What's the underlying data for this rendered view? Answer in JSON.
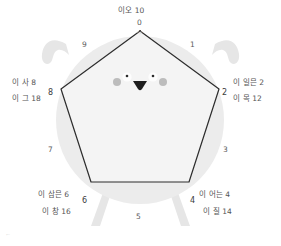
{
  "figure": {
    "title_label": "이오 10",
    "colors": {
      "body_fill": "#ececec",
      "limb_fill": "#e4e4e4",
      "pentagon_fill": "#f4f4f4",
      "pentagon_stroke": "#2d2d2d",
      "eye_white": "#fdfdfd",
      "pupil": "#2b2b2b",
      "blush": "#b9b9b9",
      "mouth": "#1d1d1d",
      "tick_text": "#5a5a5a",
      "label_text": "#555555",
      "background": "#ffffff"
    },
    "shape": {
      "type": "pentagon",
      "sides": 5,
      "tick_count": 10
    },
    "ticks": [
      {
        "id": "tick-0",
        "value": "0",
        "x": 137,
        "y": 18
      },
      {
        "id": "tick-1",
        "value": "1",
        "x": 190,
        "y": 40
      },
      {
        "id": "tick-2",
        "value": "2",
        "x": 222,
        "y": 88
      },
      {
        "id": "tick-3",
        "value": "3",
        "x": 223,
        "y": 145
      },
      {
        "id": "tick-4",
        "value": "4",
        "x": 190,
        "y": 196
      },
      {
        "id": "tick-5",
        "value": "5",
        "x": 136,
        "y": 212
      },
      {
        "id": "tick-6",
        "value": "6",
        "x": 82,
        "y": 196
      },
      {
        "id": "tick-7",
        "value": "7",
        "x": 48,
        "y": 145
      },
      {
        "id": "tick-8",
        "value": "8",
        "x": 48,
        "y": 88
      },
      {
        "id": "tick-9",
        "value": "9",
        "x": 82,
        "y": 40
      }
    ],
    "vertex_labels": [
      {
        "id": "vertex-label-top",
        "position": "top",
        "lines": [
          "이오 10"
        ],
        "x": 118,
        "y": 4,
        "align": "left"
      },
      {
        "id": "vertex-label-right",
        "position": "right",
        "lines": [
          "이 일믄 2",
          "이 목 12"
        ],
        "x": 233,
        "y": 76,
        "align": "left"
      },
      {
        "id": "vertex-label-bottom-right",
        "position": "bottom-right",
        "lines": [
          "이 어는 4",
          "이 질 14"
        ],
        "x": 199,
        "y": 188,
        "align": "left"
      },
      {
        "id": "vertex-label-bottom-left",
        "position": "bottom-left",
        "lines": [
          "이 삼믄 6",
          "이 창 16"
        ],
        "x": 38,
        "y": 188,
        "align": "left"
      },
      {
        "id": "vertex-label-left",
        "position": "left",
        "lines": [
          "이 사 8",
          "이 그 18"
        ],
        "x": 12,
        "y": 76,
        "align": "left"
      }
    ],
    "corner_mark": "⌐",
    "apex_scribble": "///"
  }
}
